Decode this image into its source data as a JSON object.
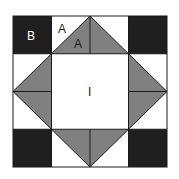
{
  "diagram": {
    "type": "quilt-block",
    "grid": "4x4",
    "colors": {
      "dark": "#1f1f1f",
      "medium": "#808080",
      "light": "#ffffff",
      "line": "#1a1a1a"
    },
    "labels": {
      "corner_square": "B",
      "triangle_light": "A",
      "triangle_dark": "A",
      "center": "I"
    }
  }
}
